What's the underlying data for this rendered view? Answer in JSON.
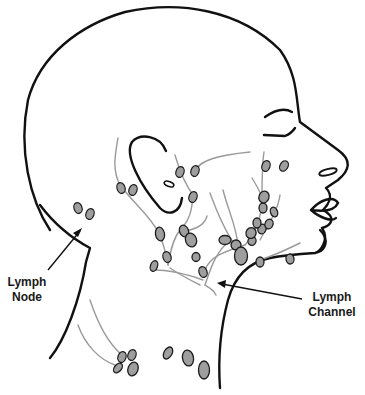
{
  "diagram": {
    "labels": {
      "node_line1": "Lymph",
      "node_line2": "Node",
      "channel_line1": "Lymph",
      "channel_line2": "Channel"
    },
    "colors": {
      "outline": "#111111",
      "channel": "#9a9a9a",
      "node_fill": "#9e9e9e",
      "node_stroke": "#1c1c1c",
      "background": "#ffffff"
    }
  }
}
